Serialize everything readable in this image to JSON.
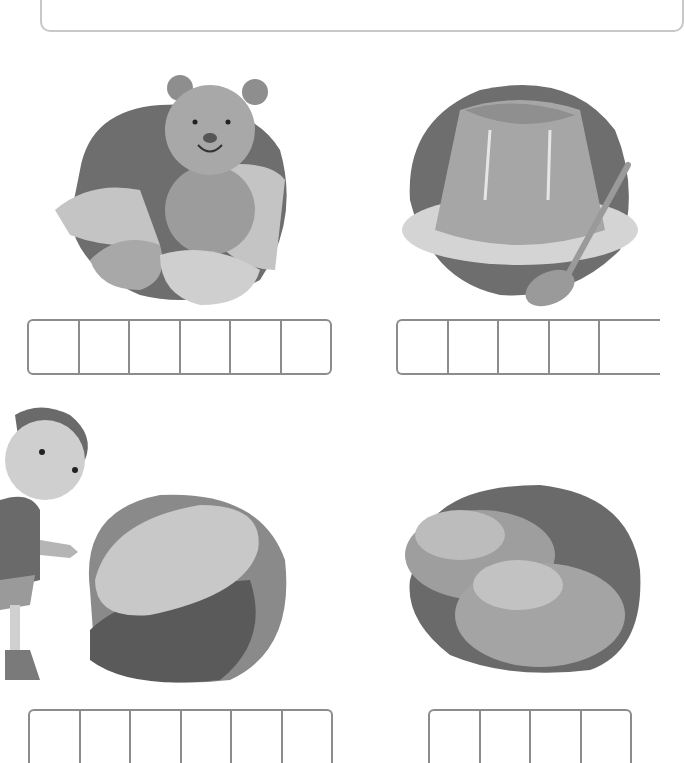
{
  "hint": {
    "label": "보기",
    "words": "딱딱해요, 폭신폭신해요, 부드러워요, 거칠거칠해요"
  },
  "items": [
    {
      "subject": "teddy bear with pillows",
      "cells": 6
    },
    {
      "subject": "jelly pudding on plate with spoon",
      "cells": 5
    },
    {
      "subject": "scrub brush with girl pointing",
      "cells": 6
    },
    {
      "subject": "potatoes",
      "cells": 4
    }
  ],
  "colors": {
    "blob_dark": "#6e6e6e",
    "mid": "#a0a0a0",
    "light": "#c8c8c8",
    "box_border": "#8c8c8c",
    "label_bg": "#7d7d7d"
  }
}
